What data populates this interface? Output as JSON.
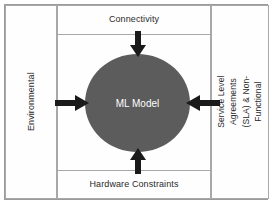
{
  "diagram": {
    "center": {
      "label": "ML Model",
      "shape": "ellipse",
      "fill_color": "#5c5c5c",
      "text_color": "#ffffff"
    },
    "panels": {
      "top": {
        "label": "Connectivity",
        "position": "top",
        "orientation": "horizontal"
      },
      "bottom": {
        "label": "Hardware Constraints",
        "position": "bottom",
        "orientation": "horizontal"
      },
      "left": {
        "label": "Environmental",
        "position": "left",
        "orientation": "vertical"
      },
      "right": {
        "label": "Service Level Agreements (SLA) & Non-Functional",
        "position": "right",
        "orientation": "vertical"
      }
    },
    "arrows": [
      {
        "name": "connectivity-to-model",
        "direction": "down",
        "from": "Connectivity",
        "to": "ML Model"
      },
      {
        "name": "hardware-to-model",
        "direction": "up",
        "from": "Hardware Constraints",
        "to": "ML Model"
      },
      {
        "name": "environmental-to-model",
        "direction": "right",
        "from": "Environmental",
        "to": "ML Model"
      },
      {
        "name": "sla-to-model",
        "direction": "left",
        "from": "Service Level Agreements (SLA) & Non-Functional",
        "to": "ML Model"
      }
    ],
    "colors": {
      "frame_border": "#9a9a9a",
      "panel_border": "#a8a8a8",
      "arrow": "#1a1a1a",
      "background": "#ffffff",
      "label_text": "#2b2b2b"
    }
  }
}
